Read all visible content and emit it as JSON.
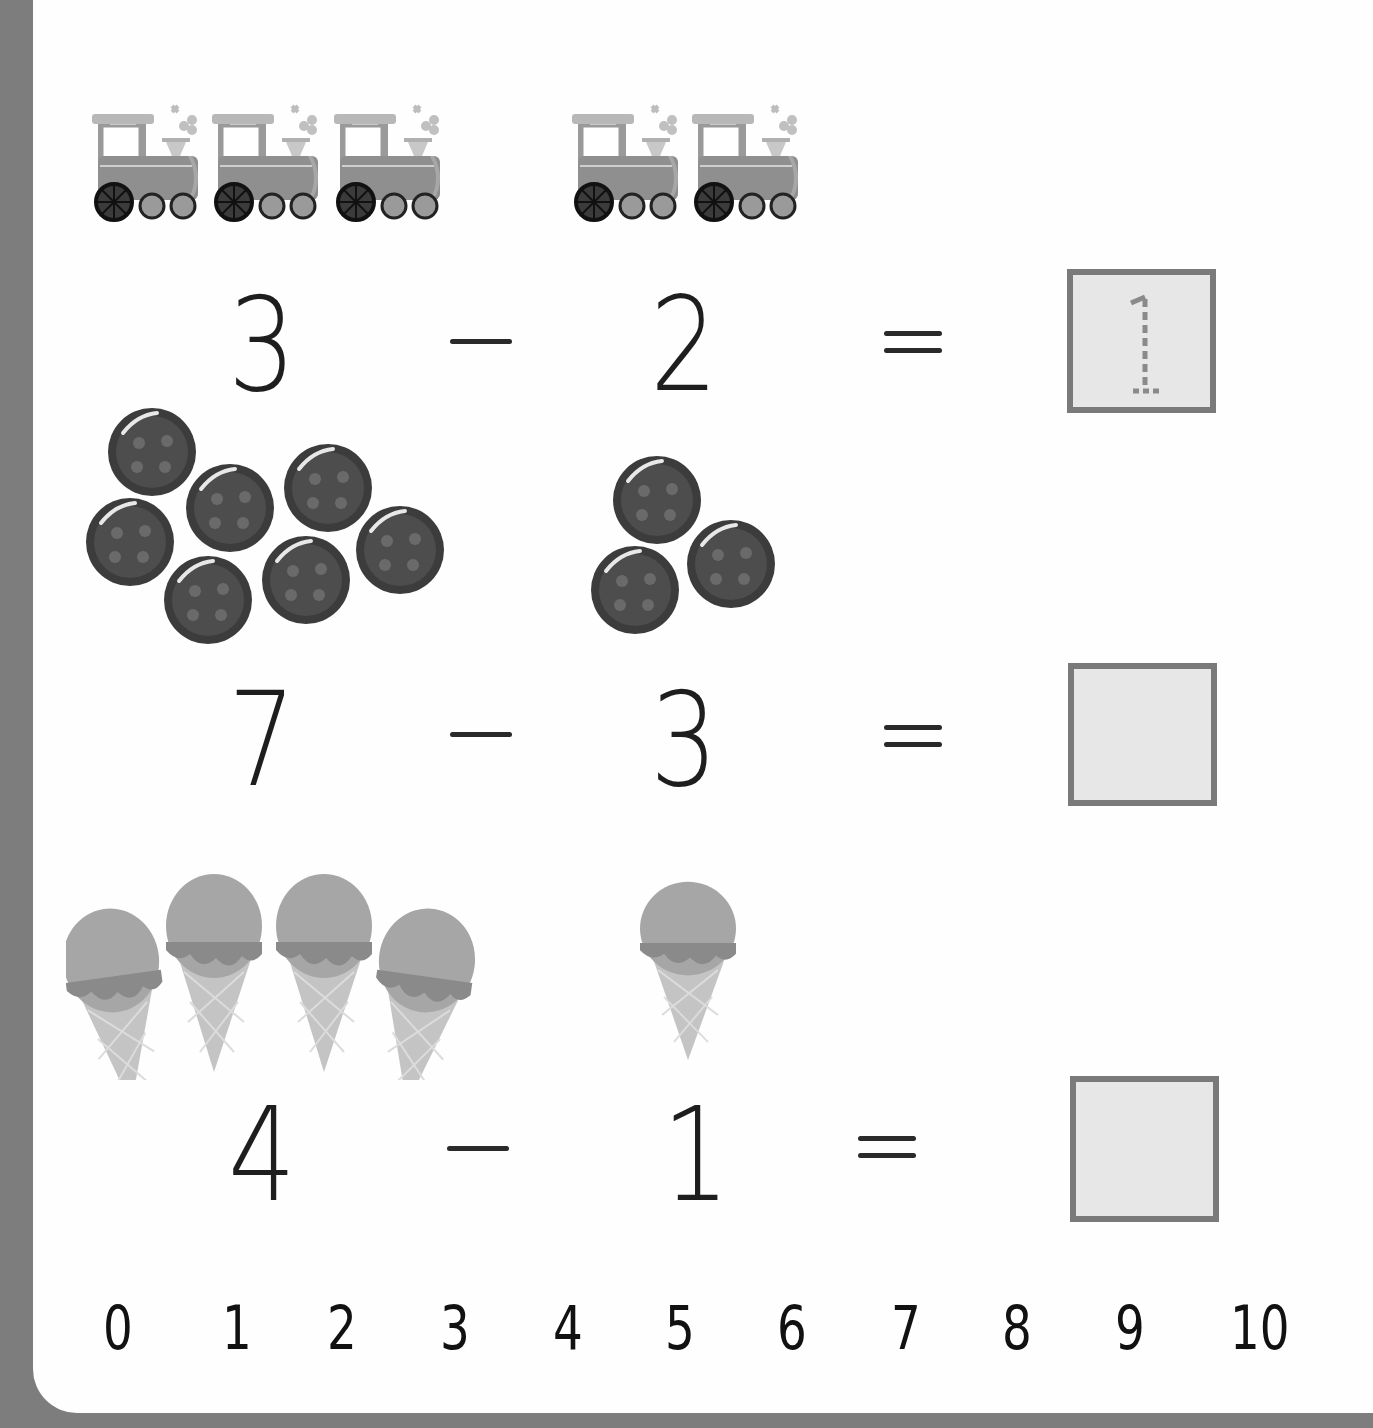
{
  "worksheet": {
    "type": "subtraction practice",
    "problems": [
      {
        "picture": "train",
        "left_count": 3,
        "right_count": 2,
        "minuend": "3",
        "operator": "−",
        "subtrahend": "2",
        "equals": "=",
        "answer": "1",
        "answer_style": "dashed trace"
      },
      {
        "picture": "button",
        "left_count": 7,
        "right_count": 3,
        "minuend": "7",
        "operator": "−",
        "subtrahend": "3",
        "equals": "=",
        "answer": "",
        "answer_style": "empty box"
      },
      {
        "picture": "ice-cream-cone",
        "left_count": 4,
        "right_count": 1,
        "minuend": "4",
        "operator": "−",
        "subtrahend": "1",
        "equals": "=",
        "answer": "",
        "answer_style": "empty box"
      }
    ],
    "number_line": [
      "0",
      "1",
      "2",
      "3",
      "4",
      "5",
      "6",
      "7",
      "8",
      "9",
      "10"
    ]
  },
  "colors": {
    "frame": "#7d7d7d",
    "page": "#fefefe",
    "box_border": "#7a7a7a",
    "box_fill": "#e7e7e7",
    "ink": "#1e1e1e"
  }
}
